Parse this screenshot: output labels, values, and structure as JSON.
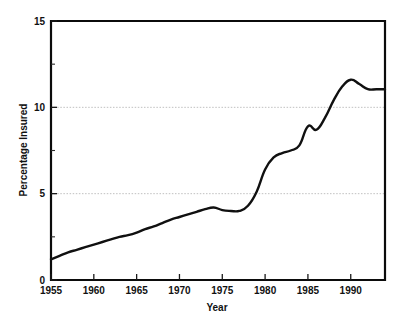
{
  "chart_data": {
    "type": "line",
    "title": "",
    "xlabel": "Year",
    "ylabel": "Percentage Insured",
    "xlim": [
      1955,
      1994
    ],
    "ylim": [
      0,
      15
    ],
    "grid": "horizontal-dotted-at-5-and-10",
    "legend": "none",
    "x_tick_labels": [
      "1955",
      "1960",
      "1965",
      "1970",
      "1975",
      "1980",
      "1985",
      "1990"
    ],
    "x_ticks": [
      1955,
      1960,
      1965,
      1970,
      1975,
      1980,
      1985,
      1990
    ],
    "y_tick_labels": [
      "0",
      "5",
      "10",
      "15"
    ],
    "y_ticks": [
      0,
      5,
      10,
      15
    ],
    "y_minor_ticks": [
      2.5,
      7.5,
      12.5
    ],
    "series": [
      {
        "name": "Percentage Insured",
        "color": "#101010",
        "x": [
          1955,
          1956,
          1957,
          1958,
          1959,
          1960,
          1961,
          1962,
          1963,
          1964,
          1965,
          1966,
          1967,
          1968,
          1969,
          1970,
          1971,
          1972,
          1973,
          1974,
          1975,
          1976,
          1977,
          1978,
          1979,
          1980,
          1981,
          1982,
          1983,
          1984,
          1985,
          1986,
          1987,
          1988,
          1989,
          1990,
          1991,
          1992,
          1993,
          1994
        ],
        "values": [
          1.2,
          1.4,
          1.6,
          1.75,
          1.9,
          2.05,
          2.2,
          2.35,
          2.5,
          2.6,
          2.75,
          2.95,
          3.1,
          3.3,
          3.5,
          3.65,
          3.8,
          3.95,
          4.1,
          4.2,
          4.05,
          4.0,
          4.0,
          4.3,
          5.1,
          6.4,
          7.1,
          7.35,
          7.5,
          7.8,
          8.9,
          8.7,
          9.4,
          10.4,
          11.2,
          11.6,
          11.35,
          11.05,
          11.05,
          11.05
        ]
      }
    ]
  },
  "axis": {
    "y_label": "Percentage Insured",
    "x_label": "Year"
  },
  "ticks": {
    "y": [
      {
        "value": 15,
        "label": "15"
      },
      {
        "value": 10,
        "label": "10"
      },
      {
        "value": 5,
        "label": "5"
      },
      {
        "value": 0,
        "label": "0"
      }
    ],
    "x": [
      {
        "value": 1955,
        "label": "1955"
      },
      {
        "value": 1960,
        "label": "1960"
      },
      {
        "value": 1965,
        "label": "1965"
      },
      {
        "value": 1970,
        "label": "1970"
      },
      {
        "value": 1975,
        "label": "1975"
      },
      {
        "value": 1980,
        "label": "1980"
      },
      {
        "value": 1985,
        "label": "1985"
      },
      {
        "value": 1990,
        "label": "1990"
      }
    ]
  }
}
